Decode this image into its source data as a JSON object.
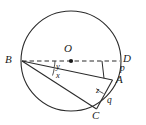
{
  "figure": {
    "type": "circle-geometry-diagram",
    "stroke_color": "#2b2b2b",
    "background_color": "#ffffff",
    "text_color": "#1a1a1a",
    "circle": {
      "cx": 71,
      "cy": 61,
      "r": 50
    },
    "points": [
      {
        "id": "O",
        "label": "O",
        "x": 71,
        "y": 61,
        "label_x": 66,
        "label_y": 44,
        "dot": true
      },
      {
        "id": "B",
        "label": "B",
        "x": 21.5,
        "y": 61,
        "label_x": 6,
        "label_y": 55,
        "dot": false
      },
      {
        "id": "D",
        "label": "D",
        "x": 121,
        "y": 61,
        "label_x": 124,
        "label_y": 54,
        "dot": false
      },
      {
        "id": "A",
        "label": "A",
        "x": 112,
        "y": 80,
        "label_x": 117,
        "label_y": 76,
        "dot": false
      },
      {
        "id": "C",
        "label": "C",
        "x": 96,
        "y": 110,
        "label_x": 93,
        "label_y": 110,
        "dot": false
      }
    ],
    "angle_labels": [
      {
        "id": "y",
        "label": "y",
        "x": 57,
        "y": 64,
        "at_vertex": "B",
        "between": "BD-BA"
      },
      {
        "id": "x",
        "label": "x",
        "x": 57,
        "y": 73,
        "at_vertex": "B",
        "between": "BA-BC"
      },
      {
        "id": "z",
        "label": "z",
        "x": 97,
        "y": 89,
        "at_vertex": "A",
        "between": "AB-AC"
      }
    ],
    "arc_labels": [
      {
        "id": "p",
        "label": "p",
        "x": 120,
        "y": 66,
        "arc_between": "D-A"
      },
      {
        "id": "q",
        "label": "q",
        "x": 108,
        "y": 98,
        "arc_between": "A-C"
      }
    ],
    "segments": [
      {
        "id": "BD",
        "from": "B",
        "to": "D",
        "style": "dashed",
        "name": "diameter-bd"
      },
      {
        "id": "BA",
        "from": "B",
        "to": "A",
        "style": "solid",
        "name": "chord-ba"
      },
      {
        "id": "BC",
        "from": "B",
        "to": "C",
        "style": "solid",
        "name": "chord-bc"
      },
      {
        "id": "AC",
        "from": "A",
        "to": "C",
        "style": "solid",
        "name": "chord-ac"
      },
      {
        "id": "AP",
        "from": "A",
        "to": "perp-foot-on-bd",
        "style": "solid",
        "name": "perpendicular-a-to-bd"
      }
    ]
  }
}
